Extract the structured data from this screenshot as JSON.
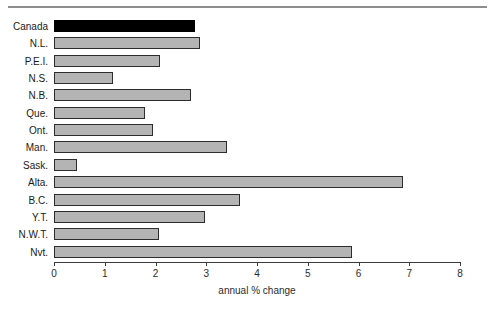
{
  "chart_data": {
    "type": "bar",
    "orientation": "horizontal",
    "title": "",
    "xlabel": "annual % change",
    "ylabel": "",
    "xlim": [
      0,
      8
    ],
    "xticks": [
      "0",
      "1",
      "2",
      "3",
      "4",
      "5",
      "6",
      "7",
      "8"
    ],
    "grid": false,
    "legend": null,
    "categories": [
      "Canada",
      "N.L.",
      "P.E.I.",
      "N.S.",
      "N.B.",
      "Que.",
      "Ont.",
      "Man.",
      "Sask.",
      "Alta.",
      "B.C.",
      "Y.T.",
      "N.W.T.",
      "Nvt."
    ],
    "values": [
      2.78,
      2.88,
      2.09,
      1.16,
      2.7,
      1.79,
      1.95,
      3.41,
      0.45,
      6.88,
      3.66,
      2.98,
      2.07,
      5.87
    ],
    "highlight_index": 0,
    "colors": {
      "bar_fill": "#b4b4b4",
      "bar_stroke": "#2d2d2d",
      "highlight_fill": "#000000",
      "axis": "#3a3a3a",
      "rule": "#8d8d8d",
      "text": "#1a1a1a",
      "background": "#ffffff"
    }
  }
}
